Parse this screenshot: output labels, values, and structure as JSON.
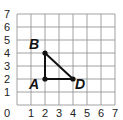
{
  "diagram": {
    "type": "coordinate-grid",
    "x_ticks": [
      "0",
      "1",
      "2",
      "3",
      "4",
      "5",
      "6",
      "7"
    ],
    "y_ticks": [
      "1",
      "2",
      "3",
      "4",
      "5",
      "6",
      "7"
    ],
    "range": {
      "x": [
        0,
        7
      ],
      "y": [
        0,
        7
      ]
    },
    "points": [
      {
        "label": "A",
        "x": 2,
        "y": 2
      },
      {
        "label": "B",
        "x": 2,
        "y": 4
      },
      {
        "label": "D",
        "x": 4,
        "y": 2
      }
    ],
    "segments": [
      [
        "A",
        "B"
      ],
      [
        "B",
        "D"
      ],
      [
        "D",
        "A"
      ]
    ],
    "colors": {
      "grid": "#8a8a8a",
      "shape": "#111111",
      "text": "#222222"
    }
  }
}
